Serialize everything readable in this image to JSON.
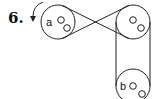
{
  "problem": {
    "number": "6.",
    "pulleys": [
      {
        "id": "a",
        "label": "a",
        "position": "top-left"
      },
      {
        "id": "c",
        "label": "",
        "position": "top-right"
      },
      {
        "id": "b",
        "label": "b",
        "position": "bottom-right"
      }
    ],
    "belts": [
      {
        "from": "a",
        "to": "c",
        "type": "crossed"
      },
      {
        "from": "c",
        "to": "b",
        "type": "open"
      }
    ],
    "rotation": "counterclockwise arrow on pulley a",
    "colors": {
      "stroke": "#222222",
      "background": "#ffffff"
    }
  }
}
